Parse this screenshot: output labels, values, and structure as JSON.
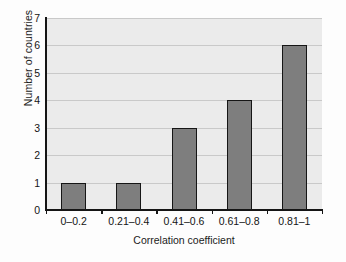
{
  "chart_data": {
    "type": "bar",
    "title": "",
    "xlabel": "Correlation coefficient",
    "ylabel": "Number of countries",
    "categories": [
      "0–0.2",
      "0.21–0.4",
      "0.41–0.6",
      "0.61–0.8",
      "0.81–1"
    ],
    "values": [
      1,
      1,
      3,
      4,
      6
    ],
    "ylim": [
      0,
      7
    ],
    "yticks": [
      0,
      1,
      2,
      3,
      4,
      5,
      6,
      7
    ],
    "ytick_labels": [
      "0",
      "1",
      "2",
      "3",
      "4",
      "5",
      "6",
      "7"
    ],
    "grid": true,
    "grid_axis": "y",
    "legend": false,
    "legend_position": "none",
    "series": [
      {
        "name": "Number of countries",
        "values": [
          1,
          1,
          3,
          4,
          6
        ]
      }
    ]
  },
  "style": {
    "bar_fill": "#7e7e7e",
    "bar_border": "#161616",
    "plot_background": "#ebebeb",
    "grid_color": "#c9c9c9",
    "axis_color": "#151515",
    "figure_background": "#fdfdfd",
    "text_color": "#141414"
  }
}
